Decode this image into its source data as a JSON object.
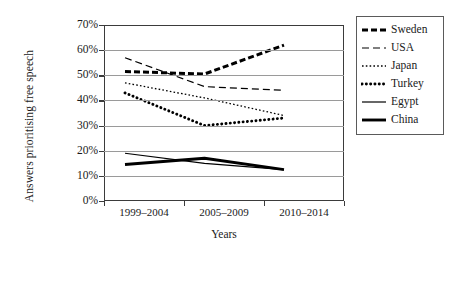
{
  "chart_data": {
    "type": "line",
    "title": "",
    "xlabel": "Years",
    "ylabel": "Answers prioritising free speech",
    "categories": [
      "1999–2004",
      "2005–2009",
      "2010–2014"
    ],
    "ylim": [
      0,
      70
    ],
    "ytick_labels": [
      "0%",
      "10%",
      "20%",
      "30%",
      "40%",
      "50%",
      "60%",
      "70%"
    ],
    "ytick_values": [
      0,
      10,
      20,
      30,
      40,
      50,
      60,
      70
    ],
    "grid": true,
    "legend_position": "right",
    "series": [
      {
        "name": "Sweden",
        "values": [
          51.5,
          50.5,
          62.0
        ],
        "style": "thick-dashed"
      },
      {
        "name": "USA",
        "values": [
          57.0,
          45.5,
          44.0
        ],
        "style": "thin-dashed"
      },
      {
        "name": "Japan",
        "values": [
          47.0,
          41.0,
          34.0
        ],
        "style": "fine-dotted"
      },
      {
        "name": "Turkey",
        "values": [
          43.0,
          30.0,
          33.0
        ],
        "style": "thick-dotted"
      },
      {
        "name": "Egypt",
        "values": [
          19.0,
          15.0,
          12.5
        ],
        "style": "thin-solid"
      },
      {
        "name": "China",
        "values": [
          14.5,
          17.0,
          12.5
        ],
        "style": "thick-solid"
      }
    ]
  },
  "axes": {
    "y_title": "Answers prioritising free speech",
    "x_title": "Years",
    "y_ticks": [
      "70%",
      "60%",
      "50%",
      "40%",
      "30%",
      "20%",
      "10%",
      "0%"
    ],
    "x_ticks": [
      "1999–2004",
      "2005–2009",
      "2010–2014"
    ]
  },
  "legend": {
    "entries": [
      {
        "label": "Sweden"
      },
      {
        "label": "USA"
      },
      {
        "label": "Japan"
      },
      {
        "label": "Turkey"
      },
      {
        "label": "Egypt"
      },
      {
        "label": "China"
      }
    ]
  },
  "colors": {
    "line": "#000000",
    "grid": "#9a9a9a",
    "frame": "#3b3b3b",
    "background": "#ffffff"
  }
}
